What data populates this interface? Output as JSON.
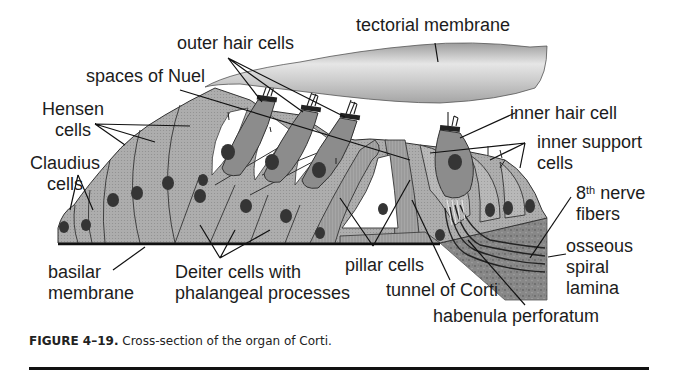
{
  "figure": {
    "title": "Cross-section of the organ of Corti",
    "labels": {
      "tectorial_membrane": "tectorial membrane",
      "outer_hair_cells": "outer hair cells",
      "spaces_of_nuel": "spaces of Nuel",
      "hensen_cells_1": "Hensen",
      "hensen_cells_2": "cells",
      "claudius_cells_1": "Claudius",
      "claudius_cells_2": "cells",
      "basilar_membrane_1": "basilar",
      "basilar_membrane_2": "membrane",
      "deiter_cells_1": "Deiter cells with",
      "deiter_cells_2": "phalangeal processes",
      "pillar_cells": "pillar cells",
      "tunnel_of_corti": "tunnel of Corti",
      "habenula_perforatum": "habenula perforatum",
      "inner_hair_cell": "inner hair cell",
      "inner_support_cells_1": "inner support",
      "inner_support_cells_2": "cells",
      "nerve_fibers_num": "8",
      "nerve_fibers_sup": "th",
      "nerve_fibers_1": " nerve",
      "nerve_fibers_2": "fibers",
      "osseous_spiral_lamina_1": "osseous",
      "osseous_spiral_lamina_2": "spiral",
      "osseous_spiral_lamina_3": "lamina"
    },
    "caption": {
      "number": "FIGURE 4–19.",
      "text": " Cross-section of the organ of Corti."
    },
    "colors": {
      "cell_fill": "#a9a9a9",
      "hair_cell_fill": "#8c8c8c",
      "tectorial_light": "#e8e8e8",
      "tectorial_dark": "#9a9a9a",
      "nucleus": "#3a3a3a",
      "bone": "#7d7d7d",
      "outline": "#2a2a2a"
    }
  }
}
